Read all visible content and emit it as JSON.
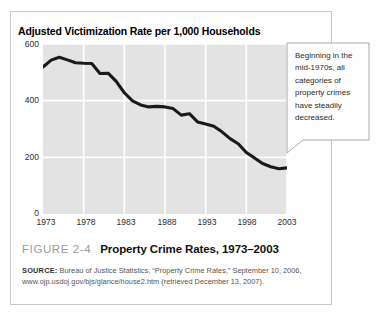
{
  "figure": {
    "number_label": "FIGURE 2-4",
    "caption": "Property Crime Rates, 1973–2003",
    "source_label": "SOURCE:",
    "source_text": " Bureau of Justice Statistics, “Property Crime Rates,” September 10, 2006, www.ojp.usdoj.gov/bjs/glance/house2.htm (retrieved December 13, 2007)."
  },
  "callout": {
    "text": "Beginning in the mid-1970s, all categories of property crimes have steadily decreased."
  },
  "colors": {
    "plot_background": "#e3e3e3",
    "gridline": "#ffffff",
    "series_line": "#1a1a1a",
    "figure_border": "#c8c8c8",
    "callout_border": "#a8a8a8",
    "figure_number_text": "#9a9a9a"
  },
  "chart_data": {
    "type": "line",
    "title": "Adjusted Victimization Rate per 1,000 Households",
    "xlabel": "",
    "ylabel": "",
    "xlim": [
      1973,
      2003
    ],
    "ylim": [
      0,
      600
    ],
    "grid": true,
    "legend": "none",
    "yticks": [
      600,
      400,
      200,
      0
    ],
    "xticks": [
      1973,
      1978,
      1983,
      1988,
      1993,
      1998,
      2003
    ],
    "x": [
      1973,
      1974,
      1975,
      1976,
      1977,
      1978,
      1979,
      1980,
      1981,
      1982,
      1983,
      1984,
      1985,
      1986,
      1987,
      1988,
      1989,
      1990,
      1991,
      1992,
      1993,
      1994,
      1995,
      1996,
      1997,
      1998,
      1999,
      2000,
      2001,
      2002,
      2003
    ],
    "values": [
      519,
      543,
      553,
      544,
      534,
      532,
      531,
      496,
      497,
      468,
      428,
      399,
      385,
      378,
      380,
      378,
      372,
      349,
      354,
      325,
      318,
      310,
      290,
      266,
      248,
      217,
      198,
      178,
      167,
      160,
      163
    ],
    "series": [
      {
        "name": "Adjusted victimization rate per 1,000 households",
        "values": [
          519,
          543,
          553,
          544,
          534,
          532,
          531,
          496,
          497,
          468,
          428,
          399,
          385,
          378,
          380,
          378,
          372,
          349,
          354,
          325,
          318,
          310,
          290,
          266,
          248,
          217,
          198,
          178,
          167,
          160,
          163
        ]
      }
    ]
  }
}
